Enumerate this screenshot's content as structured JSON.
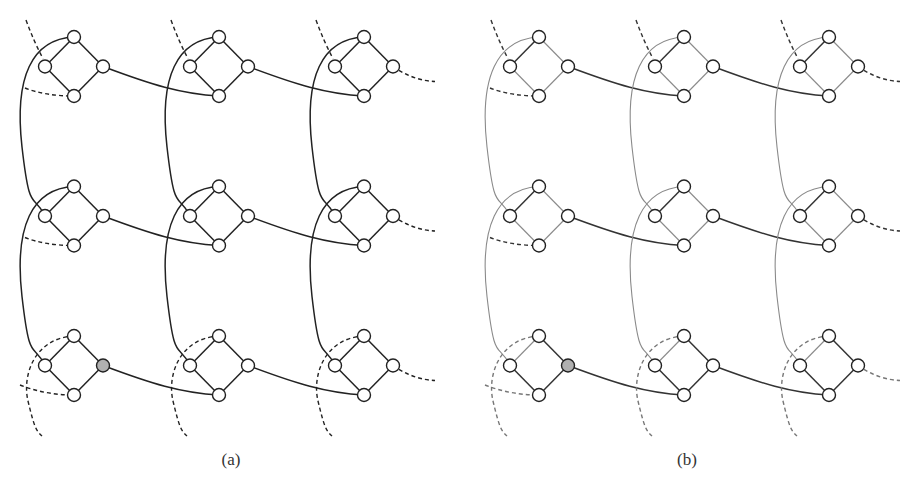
{
  "figure": {
    "panels": [
      {
        "id": "a",
        "caption": "(a)",
        "caption_x": 231,
        "offset_x": 0,
        "colors": {
          "strong": "#222222",
          "weak": "#222222",
          "dashed_top": "#222222",
          "dashed_bottom": "#222222"
        }
      },
      {
        "id": "b",
        "caption": "(b)",
        "caption_x": 687,
        "offset_x": 465,
        "colors": {
          "strong": "#333333",
          "weak": "#8a8a8a",
          "dashed_top": "#333333",
          "dashed_bottom": "#777777"
        }
      }
    ],
    "grid": {
      "rows": 3,
      "cols": 3,
      "origin": {
        "x": 74,
        "y": 37
      },
      "col_spacing": 145,
      "row_spacing": 149.5,
      "half_width": 29,
      "half_height": 29.5,
      "node_radius": 6.5
    },
    "node_fill": "#ffffff",
    "highlight_fill": "#b0b0b0",
    "highlighted_node": {
      "row": 2,
      "col": 0,
      "position": "right"
    },
    "gadget": "diamond of 4 nodes (top, left, right, bottom) per grid cell"
  }
}
